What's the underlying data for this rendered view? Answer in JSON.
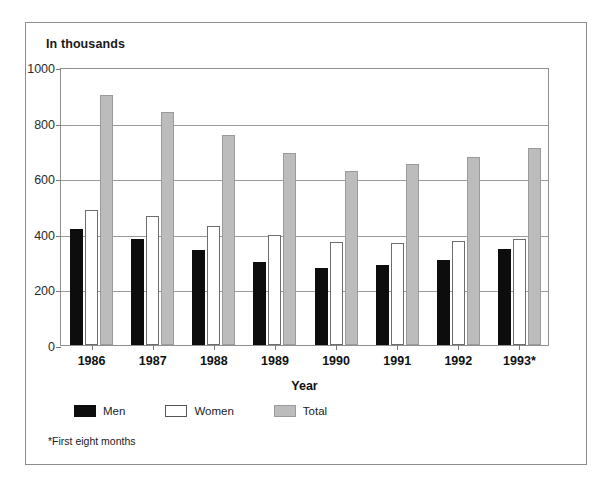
{
  "chart_data": {
    "type": "bar",
    "title": "In thousands",
    "xlabel": "Year",
    "ylabel": "",
    "ylim": [
      0,
      1000
    ],
    "yticks": [
      0,
      200,
      400,
      600,
      800,
      1000
    ],
    "grid": true,
    "legend_position": "bottom-left",
    "categories": [
      "1986",
      "1987",
      "1988",
      "1989",
      "1990",
      "1991",
      "1992",
      "1993*"
    ],
    "series": [
      {
        "name": "Men",
        "color": "#0d0d0d",
        "values": [
          417,
          380,
          340,
          300,
          277,
          288,
          305,
          345
        ]
      },
      {
        "name": "Women",
        "color": "#ffffff",
        "values": [
          487,
          465,
          427,
          396,
          370,
          368,
          375,
          380
        ]
      },
      {
        "name": "Total",
        "color": "#bcbcbc",
        "values": [
          900,
          838,
          755,
          690,
          625,
          652,
          675,
          708
        ]
      }
    ],
    "annotations": [
      "*First eight months"
    ]
  },
  "footnote": "*First eight months"
}
